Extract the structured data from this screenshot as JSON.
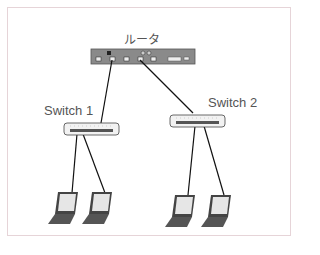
{
  "diagram": {
    "router": {
      "label": "ルータ"
    },
    "switches": [
      {
        "label": "Switch 1"
      },
      {
        "label": "Switch 2"
      }
    ],
    "clients": [
      {
        "type": "laptop",
        "connected_to": "Switch 1"
      },
      {
        "type": "laptop",
        "connected_to": "Switch 1"
      },
      {
        "type": "laptop",
        "connected_to": "Switch 2"
      },
      {
        "type": "laptop",
        "connected_to": "Switch 2"
      }
    ],
    "colors": {
      "frame_border": "#e6d4d8",
      "router_body": "#8a8a8a",
      "cable": "#111111"
    }
  }
}
